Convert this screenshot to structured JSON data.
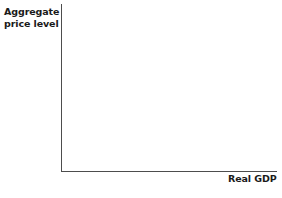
{
  "chart_data": {
    "type": "line",
    "title": "",
    "subtitle": "",
    "xlabel": "Real GDP",
    "ylabel_line1": "Aggregate",
    "ylabel_line2": "price level",
    "series": [],
    "categories": [],
    "x_ticks": [],
    "y_ticks": [],
    "grid": false,
    "legend": false,
    "annotations": []
  },
  "axes": {
    "y_label_line1": "Aggregate",
    "y_label_line2": "price level",
    "x_label": "Real GDP",
    "axis_color": "#4d4d4d",
    "label_color": "#1a1a1a",
    "background_color": "#ffffff"
  }
}
